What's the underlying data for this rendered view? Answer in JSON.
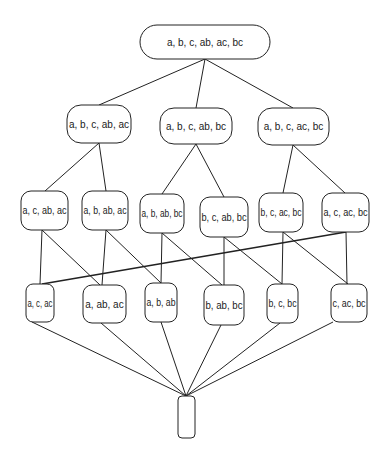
{
  "diagram": {
    "type": "lattice",
    "nodes": [
      {
        "id": "top",
        "label": "a, b, c, ab, ac, bc",
        "x": 140,
        "y": 25,
        "w": 130,
        "h": 34,
        "rx": 17
      },
      {
        "id": "r2a",
        "label": "a, b, c, ab, ac",
        "x": 67,
        "y": 105,
        "w": 64,
        "h": 38,
        "rx": 14
      },
      {
        "id": "r2b",
        "label": "a,  b, c, ab, bc",
        "x": 160,
        "y": 108,
        "w": 72,
        "h": 36,
        "rx": 14
      },
      {
        "id": "r2c",
        "label": "a, b, c, ac, bc",
        "x": 258,
        "y": 108,
        "w": 71,
        "h": 37,
        "rx": 14
      },
      {
        "id": "r3a",
        "label": "a, c, ab, ac",
        "x": 21,
        "y": 191,
        "w": 47,
        "h": 39,
        "rx": 10
      },
      {
        "id": "r3b",
        "label": "a, b, ab, ac",
        "x": 82,
        "y": 191,
        "w": 46,
        "h": 39,
        "rx": 10
      },
      {
        "id": "r3c",
        "label": "a, b, ab, bc",
        "x": 140,
        "y": 194,
        "w": 44,
        "h": 39,
        "rx": 10
      },
      {
        "id": "r3d",
        "label": "b, c, ab, bc",
        "x": 200,
        "y": 197,
        "w": 48,
        "h": 40,
        "rx": 10
      },
      {
        "id": "r3e",
        "label": "b, c, ac, bc",
        "x": 259,
        "y": 193,
        "w": 44,
        "h": 39,
        "rx": 10
      },
      {
        "id": "r3f",
        "label": "a, c, ac, bc",
        "x": 322,
        "y": 193,
        "w": 47,
        "h": 39,
        "rx": 10
      },
      {
        "id": "r4a",
        "label": "a, c, ac",
        "x": 26,
        "y": 284,
        "w": 28,
        "h": 38,
        "rx": 7
      },
      {
        "id": "r4b",
        "label": "a, ab, ac",
        "x": 83,
        "y": 285,
        "w": 43,
        "h": 38,
        "rx": 9
      },
      {
        "id": "r4c",
        "label": "a, b, ab",
        "x": 145,
        "y": 283,
        "w": 32,
        "h": 39,
        "rx": 8
      },
      {
        "id": "r4d",
        "label": "b, ab, bc",
        "x": 204,
        "y": 285,
        "w": 40,
        "h": 40,
        "rx": 9
      },
      {
        "id": "r4e",
        "label": "b, c, bc",
        "x": 267,
        "y": 284,
        "w": 31,
        "h": 39,
        "rx": 8
      },
      {
        "id": "r4f",
        "label": "c, ac, bc",
        "x": 331,
        "y": 284,
        "w": 36,
        "h": 38,
        "rx": 8
      },
      {
        "id": "bottom",
        "label": "",
        "x": 178,
        "y": 396,
        "w": 17,
        "h": 42,
        "rx": 4
      }
    ],
    "edges": [
      {
        "from": [
          205,
          59
        ],
        "to": [
          99,
          105
        ]
      },
      {
        "from": [
          205,
          59
        ],
        "to": [
          196,
          108
        ]
      },
      {
        "from": [
          205,
          59
        ],
        "to": [
          293,
          108
        ]
      },
      {
        "from": [
          99,
          143
        ],
        "to": [
          45,
          191
        ]
      },
      {
        "from": [
          99,
          143
        ],
        "to": [
          106,
          191
        ]
      },
      {
        "from": [
          196,
          144
        ],
        "to": [
          162,
          194
        ]
      },
      {
        "from": [
          196,
          144
        ],
        "to": [
          224,
          197
        ]
      },
      {
        "from": [
          293,
          145
        ],
        "to": [
          283,
          193
        ]
      },
      {
        "from": [
          293,
          145
        ],
        "to": [
          345,
          193
        ]
      },
      {
        "from": [
          42,
          230
        ],
        "to": [
          40,
          284
        ]
      },
      {
        "from": [
          42,
          230
        ],
        "to": [
          100,
          285
        ]
      },
      {
        "from": [
          106,
          230
        ],
        "to": [
          102,
          285
        ]
      },
      {
        "from": [
          106,
          230
        ],
        "to": [
          161,
          283
        ]
      },
      {
        "from": [
          162,
          233
        ],
        "to": [
          161,
          283
        ]
      },
      {
        "from": [
          162,
          233
        ],
        "to": [
          222,
          285
        ]
      },
      {
        "from": [
          224,
          237
        ],
        "to": [
          224,
          285
        ]
      },
      {
        "from": [
          224,
          237
        ],
        "to": [
          282,
          284
        ]
      },
      {
        "from": [
          283,
          232
        ],
        "to": [
          282,
          284
        ]
      },
      {
        "from": [
          283,
          232
        ],
        "to": [
          348,
          284
        ]
      },
      {
        "from": [
          346,
          232
        ],
        "to": [
          347,
          284
        ]
      },
      {
        "from": [
          346,
          232
        ],
        "to": [
          42,
          284
        ],
        "thick": true
      },
      {
        "from": [
          32,
          322
        ],
        "to": [
          186,
          396
        ]
      },
      {
        "from": [
          101,
          323
        ],
        "to": [
          186,
          396
        ]
      },
      {
        "from": [
          161,
          322
        ],
        "to": [
          186,
          396
        ]
      },
      {
        "from": [
          221,
          325
        ],
        "to": [
          186,
          396
        ]
      },
      {
        "from": [
          280,
          323
        ],
        "to": [
          186,
          396
        ]
      },
      {
        "from": [
          333,
          322
        ],
        "to": [
          186,
          396
        ]
      }
    ]
  }
}
